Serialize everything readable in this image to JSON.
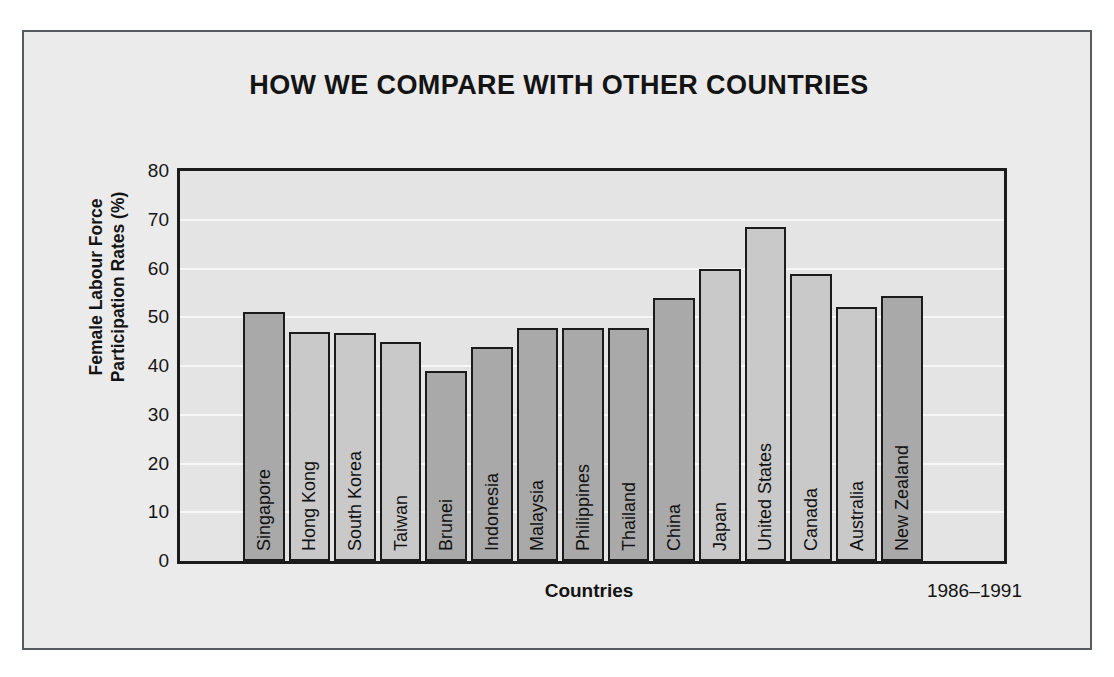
{
  "figure": {
    "title": "HOW WE COMPARE WITH OTHER COUNTRIES",
    "period_label": "1986–1991",
    "frame_color": "#555b5e",
    "background_color": "#ebebeb",
    "plot_background_color": "#e4e4e4",
    "axis_color": "#1b1b1b",
    "bar_color_asia": "#a9a9a9",
    "bar_color_other": "#c9c9c9"
  },
  "chart_data": {
    "type": "bar",
    "title": "HOW WE COMPARE WITH OTHER COUNTRIES",
    "subtitle": "",
    "xlabel": "Countries",
    "ylabel": "Female Labour Force Participation Rates (%)",
    "ylabel_lines": [
      "Female Labour Force",
      "Participation Rates (%)"
    ],
    "ylim": [
      0,
      80
    ],
    "ytick_labels": [
      "0",
      "10",
      "20",
      "30",
      "40",
      "50",
      "60",
      "70",
      "80"
    ],
    "yticks": [
      0,
      10,
      20,
      30,
      40,
      50,
      60,
      70,
      80
    ],
    "grid": true,
    "grid_orientation": "horizontal",
    "legend": false,
    "legend_position": "none",
    "annotation": "1986–1991",
    "categories": [
      "Singapore",
      "Hong Kong",
      "South Korea",
      "Taiwan",
      "Brunei",
      "Indonesia",
      "Malaysia",
      "Philippines",
      "Thailand",
      "China",
      "Japan",
      "United States",
      "Canada",
      "Australia",
      "New Zealand"
    ],
    "values": [
      51,
      47,
      46.8,
      45,
      39,
      44,
      47.7,
      47.8,
      47.7,
      54,
      59.8,
      68.5,
      58.8,
      52.2,
      54.3
    ],
    "bars": [
      {
        "label": "Singapore",
        "value": 51,
        "shade": "dark"
      },
      {
        "label": "Hong Kong",
        "value": 47,
        "shade": "light"
      },
      {
        "label": "South Korea",
        "value": 46.8,
        "shade": "light"
      },
      {
        "label": "Taiwan",
        "value": 45,
        "shade": "light"
      },
      {
        "label": "Brunei",
        "value": 39,
        "shade": "dark"
      },
      {
        "label": "Indonesia",
        "value": 44,
        "shade": "dark"
      },
      {
        "label": "Malaysia",
        "value": 47.7,
        "shade": "dark"
      },
      {
        "label": "Philippines",
        "value": 47.8,
        "shade": "dark"
      },
      {
        "label": "Thailand",
        "value": 47.7,
        "shade": "dark"
      },
      {
        "label": "China",
        "value": 54,
        "shade": "dark"
      },
      {
        "label": "Japan",
        "value": 59.8,
        "shade": "light"
      },
      {
        "label": "United States",
        "value": 68.5,
        "shade": "light"
      },
      {
        "label": "Canada",
        "value": 58.8,
        "shade": "light"
      },
      {
        "label": "Australia",
        "value": 52.2,
        "shade": "light"
      },
      {
        "label": "New Zealand",
        "value": 54.3,
        "shade": "dark"
      }
    ]
  }
}
